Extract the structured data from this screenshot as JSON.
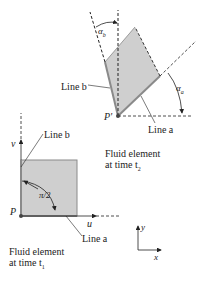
{
  "figure": {
    "top_element": {
      "point_label": "P'",
      "line_a_label": "Line a",
      "line_b_label": "Line b",
      "angle_a_label": "α",
      "angle_a_sub": "a",
      "angle_b_label": "α",
      "angle_b_sub": "b",
      "caption_line1": "Fluid element",
      "caption_line2": "at time t",
      "caption_sub": "2"
    },
    "bottom_element": {
      "point_label": "P",
      "line_a_label": "Line a",
      "line_b_label": "Line b",
      "angle_label": "π/2",
      "u_label": "u",
      "v_label": "v",
      "caption_line1": "Fluid element",
      "caption_line2": "at time t",
      "caption_sub": "1"
    },
    "axes": {
      "x_label": "x",
      "y_label": "y"
    },
    "colors": {
      "fill": "#cfcfcf",
      "edge": "#8a8a8a",
      "ink": "#222222"
    }
  }
}
